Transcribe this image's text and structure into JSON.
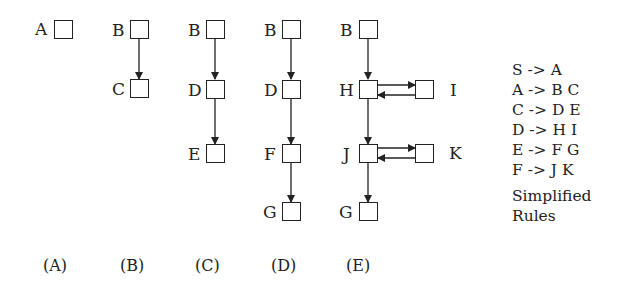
{
  "diagrams": [
    {
      "caption": "(A)",
      "nodes": [
        "A"
      ],
      "edges": []
    },
    {
      "caption": "(B)",
      "nodes": [
        "B",
        "C"
      ],
      "edges": [
        [
          "B",
          "C"
        ]
      ]
    },
    {
      "caption": "(C)",
      "nodes": [
        "B",
        "D",
        "E"
      ],
      "edges": [
        [
          "B",
          "D"
        ],
        [
          "D",
          "E"
        ]
      ]
    },
    {
      "caption": "(D)",
      "nodes": [
        "B",
        "D",
        "F",
        "G"
      ],
      "edges": [
        [
          "B",
          "D"
        ],
        [
          "D",
          "F"
        ],
        [
          "F",
          "G"
        ]
      ]
    },
    {
      "caption": "(E)",
      "nodes": [
        "B",
        "H",
        "I",
        "J",
        "K",
        "G"
      ],
      "edges": [
        [
          "B",
          "H"
        ],
        [
          "H",
          "I"
        ],
        [
          "I",
          "H"
        ],
        [
          "H",
          "J"
        ],
        [
          "J",
          "K"
        ],
        [
          "K",
          "J"
        ],
        [
          "J",
          "G"
        ]
      ]
    }
  ],
  "labels": {
    "a_A": "A",
    "b_B": "B",
    "b_C": "C",
    "c_B": "B",
    "c_D": "D",
    "c_E": "E",
    "d_B": "B",
    "d_D": "D",
    "d_F": "F",
    "d_G": "G",
    "e_B": "B",
    "e_H": "H",
    "e_I": "I",
    "e_J": "J",
    "e_K": "K",
    "e_G": "G"
  },
  "captions": [
    "(A)",
    "(B)",
    "(C)",
    "(D)",
    "(E)"
  ],
  "rules": {
    "items": [
      "S -> A",
      "A -> B C",
      "C -> D E",
      "D -> H I",
      "E -> F G",
      "F -> J K"
    ],
    "title_line1": "Simplified",
    "title_line2": "Rules"
  }
}
